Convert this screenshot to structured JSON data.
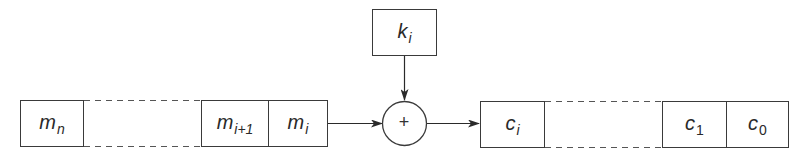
{
  "diagram": {
    "type": "stream-cipher-block",
    "colors": {
      "stroke": "#3a3a3a",
      "background": "#ffffff",
      "text": "#2a2a2a"
    },
    "plaintext_register": {
      "cells": [
        {
          "base": "m",
          "sub": "n"
        },
        {
          "base": "m",
          "sub": "i+1"
        },
        {
          "base": "m",
          "sub": "i"
        }
      ],
      "gap_between": [
        "m_n",
        "m_i+1"
      ]
    },
    "key": {
      "base": "k",
      "sub": "i"
    },
    "combiner": {
      "symbol": "+",
      "shape": "circle"
    },
    "ciphertext_register": {
      "cells": [
        {
          "base": "c",
          "sub": "i"
        },
        {
          "base": "c",
          "sub": "1"
        },
        {
          "base": "c",
          "sub": "0"
        }
      ],
      "gap_between": [
        "c_i",
        "c_1"
      ]
    },
    "arrows": [
      {
        "from": "m_i",
        "to": "combiner"
      },
      {
        "from": "k_i",
        "to": "combiner"
      },
      {
        "from": "combiner",
        "to": "c_i"
      }
    ]
  }
}
